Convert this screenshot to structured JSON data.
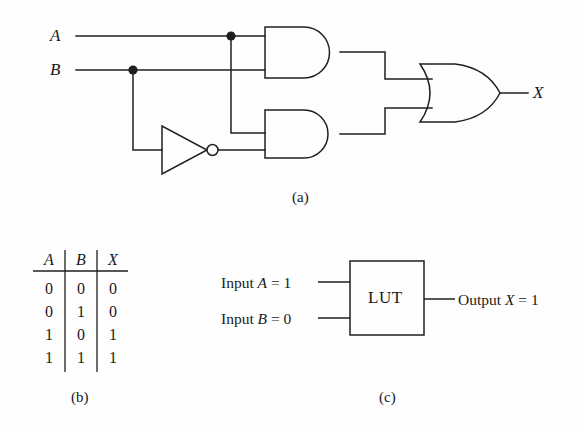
{
  "figure": {
    "type": "logic-circuit-and-lut-equivalent",
    "panels": [
      {
        "id": "a",
        "caption": "(a)",
        "description": "Logic circuit implementing X = A AND B OR A AND NOT B"
      },
      {
        "id": "b",
        "caption": "(b)",
        "description": "Truth table"
      },
      {
        "id": "c",
        "caption": "(c)",
        "description": "LUT block diagram"
      }
    ]
  },
  "circuit": {
    "inputs": [
      {
        "name": "A",
        "label": "A",
        "y": 36
      },
      {
        "name": "B",
        "label": "B",
        "y": 70
      }
    ],
    "output": {
      "name": "X",
      "label": "X"
    },
    "gates": [
      {
        "id": "and-top",
        "type": "AND",
        "label": "AND"
      },
      {
        "id": "and-bottom",
        "type": "AND",
        "label": "AND"
      },
      {
        "id": "inverter",
        "type": "NOT",
        "label": "NOT"
      },
      {
        "id": "or-gate",
        "type": "OR",
        "label": "OR"
      }
    ],
    "junction_dots": [
      {
        "on": "A",
        "x": 231,
        "y": 36
      },
      {
        "on": "B",
        "x": 133,
        "y": 70
      }
    ]
  },
  "truth_table": {
    "columns": [
      "A",
      "B",
      "X"
    ],
    "rows": [
      [
        "0",
        "0",
        "0"
      ],
      [
        "0",
        "1",
        "0"
      ],
      [
        "1",
        "0",
        "1"
      ],
      [
        "1",
        "1",
        "1"
      ]
    ]
  },
  "lut": {
    "block_label": "LUT",
    "inputs": [
      {
        "text": "Input A = 1",
        "prefix": "Input ",
        "var": "A",
        "eq": " = ",
        "value": "1"
      },
      {
        "text": "Input B = 0",
        "prefix": "Input ",
        "var": "B",
        "eq": " = ",
        "value": "0"
      }
    ],
    "output": {
      "text": "Output X = 1",
      "prefix": "Output ",
      "var": "X",
      "eq": " = ",
      "value": "1"
    }
  },
  "captions": {
    "a": "(a)",
    "b": "(b)",
    "c": "(c)"
  },
  "colors": {
    "background": "#fefefe",
    "stroke": "#1f1f1f",
    "text": "#171717"
  }
}
